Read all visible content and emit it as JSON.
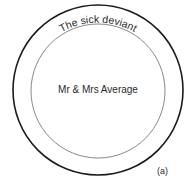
{
  "diagram": {
    "outer_label": "The sick deviant",
    "inner_label": "Mr & Mrs Average",
    "panel_label": "(a)",
    "colors": {
      "outer_stroke": "#1a1a1a",
      "inner_stroke": "#7a7a7a",
      "text": "#2a2a2a",
      "background": "#ffffff"
    }
  }
}
